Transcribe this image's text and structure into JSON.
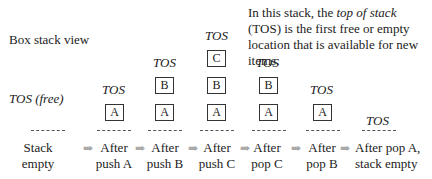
{
  "title": "Box stack view",
  "note": {
    "part1": "In this stack, the ",
    "emph": "top of stack",
    "part2": " (TOS) is the first free or empty location that is available for new items."
  },
  "arrow_glyph": "➡",
  "columns": [
    {
      "tos": "TOS (free)",
      "items": [],
      "label_line1": "Stack",
      "label_line2": "empty"
    },
    {
      "tos": "TOS",
      "items": [
        "A"
      ],
      "label_line1": "After",
      "label_line2": "push A"
    },
    {
      "tos": "TOS",
      "items": [
        "A",
        "B"
      ],
      "label_line1": "After",
      "label_line2": "push B"
    },
    {
      "tos": "TOS",
      "items": [
        "A",
        "B",
        "C"
      ],
      "label_line1": "After",
      "label_line2": "push C"
    },
    {
      "tos": "TOS",
      "items": [
        "A",
        "B"
      ],
      "label_line1": "After",
      "label_line2": "pop C"
    },
    {
      "tos": "TOS",
      "items": [
        "A"
      ],
      "label_line1": "After",
      "label_line2": "pop B"
    },
    {
      "tos": "TOS",
      "items": [],
      "label_line1": "After pop A,",
      "label_line2": "stack empty"
    }
  ]
}
